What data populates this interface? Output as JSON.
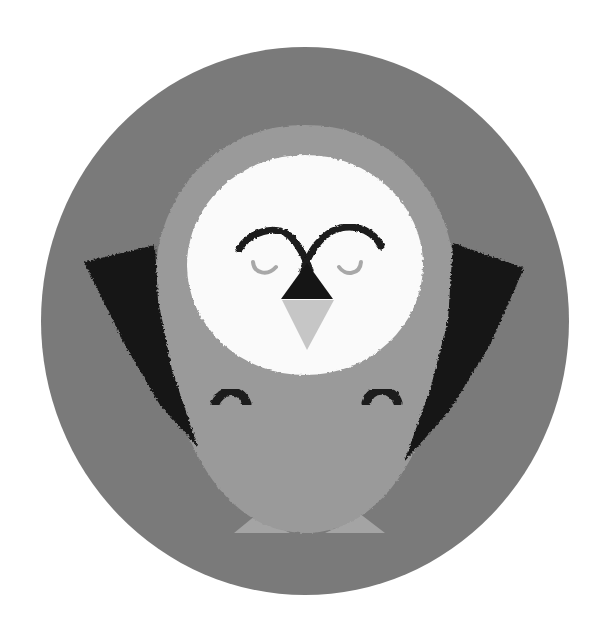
{
  "illustration": {
    "subject": "sleeping owl in circular badge",
    "colors": {
      "page_background": "#ffffff",
      "circle_background": "#7a7a7a",
      "body": "#9a9a9a",
      "feet": "#a4a4a4",
      "face_disc": "#fafafa",
      "wings": "#161616",
      "eyebrows": "#1a1a1a",
      "beak_top": "#151515",
      "beak_bottom": "#c6c6c6",
      "closed_eyes": "#a8a8a8",
      "hands": "#1a1a1a"
    }
  }
}
